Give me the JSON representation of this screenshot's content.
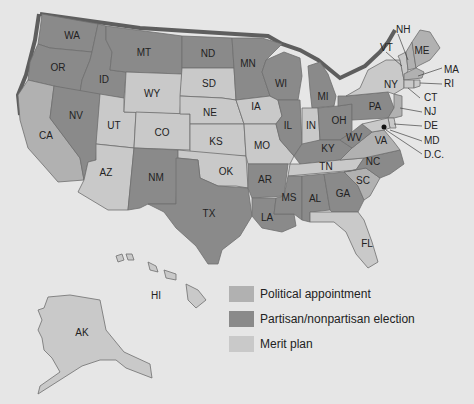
{
  "colors": {
    "background": "#e6e6e6",
    "political_appointment": "#b1b1b1",
    "election": "#8a8a8a",
    "merit_plan": "#c9c9c9",
    "shadow": "#5e5e5e"
  },
  "legend": {
    "items": [
      {
        "label": "Political appointment",
        "category": "political_appointment",
        "color": "#b1b1b1"
      },
      {
        "label": "Partisan/nonpartisan election",
        "category": "election",
        "color": "#8a8a8a"
      },
      {
        "label": "Merit plan",
        "category": "merit_plan",
        "color": "#c9c9c9"
      }
    ]
  },
  "states": {
    "WA": {
      "label": "WA",
      "category": "election"
    },
    "OR": {
      "label": "OR",
      "category": "election"
    },
    "ID": {
      "label": "ID",
      "category": "election"
    },
    "MT": {
      "label": "MT",
      "category": "election"
    },
    "ND": {
      "label": "ND",
      "category": "election"
    },
    "MN": {
      "label": "MN",
      "category": "election"
    },
    "WI": {
      "label": "WI",
      "category": "election"
    },
    "MI": {
      "label": "MI",
      "category": "election"
    },
    "NV": {
      "label": "NV",
      "category": "election"
    },
    "CA": {
      "label": "CA",
      "category": "political_appointment"
    },
    "UT": {
      "label": "UT",
      "category": "merit_plan"
    },
    "WY": {
      "label": "WY",
      "category": "merit_plan"
    },
    "SD": {
      "label": "SD",
      "category": "merit_plan"
    },
    "NE": {
      "label": "NE",
      "category": "merit_plan"
    },
    "IA": {
      "label": "IA",
      "category": "merit_plan"
    },
    "CO": {
      "label": "CO",
      "category": "merit_plan"
    },
    "KS": {
      "label": "KS",
      "category": "merit_plan"
    },
    "MO": {
      "label": "MO",
      "category": "merit_plan"
    },
    "OK": {
      "label": "OK",
      "category": "merit_plan"
    },
    "AZ": {
      "label": "AZ",
      "category": "merit_plan"
    },
    "NM": {
      "label": "NM",
      "category": "election"
    },
    "TX": {
      "label": "TX",
      "category": "election"
    },
    "AR": {
      "label": "AR",
      "category": "election"
    },
    "LA": {
      "label": "LA",
      "category": "election"
    },
    "MS": {
      "label": "MS",
      "category": "election"
    },
    "AL": {
      "label": "AL",
      "category": "election"
    },
    "GA": {
      "label": "GA",
      "category": "election"
    },
    "FL": {
      "label": "FL",
      "category": "merit_plan"
    },
    "SC": {
      "label": "SC",
      "category": "political_appointment"
    },
    "NC": {
      "label": "NC",
      "category": "election"
    },
    "TN": {
      "label": "TN",
      "category": "merit_plan"
    },
    "KY": {
      "label": "KY",
      "category": "election"
    },
    "VA": {
      "label": "VA",
      "category": "political_appointment"
    },
    "WV": {
      "label": "WV",
      "category": "election"
    },
    "OH": {
      "label": "OH",
      "category": "election"
    },
    "IN": {
      "label": "IN",
      "category": "merit_plan"
    },
    "IL": {
      "label": "IL",
      "category": "election"
    },
    "PA": {
      "label": "PA",
      "category": "election"
    },
    "NY": {
      "label": "NY",
      "category": "merit_plan"
    },
    "VT": {
      "label": "VT",
      "category": "merit_plan"
    },
    "NH": {
      "label": "NH",
      "category": "political_appointment"
    },
    "ME": {
      "label": "ME",
      "category": "political_appointment"
    },
    "MA": {
      "label": "MA",
      "category": "political_appointment"
    },
    "RI": {
      "label": "RI",
      "category": "merit_plan"
    },
    "CT": {
      "label": "CT",
      "category": "merit_plan"
    },
    "NJ": {
      "label": "NJ",
      "category": "political_appointment"
    },
    "DE": {
      "label": "DE",
      "category": "merit_plan"
    },
    "MD": {
      "label": "MD",
      "category": "merit_plan"
    },
    "DC": {
      "label": "D.C.",
      "category": "merit_plan"
    },
    "AK": {
      "label": "AK",
      "category": "merit_plan"
    },
    "HI": {
      "label": "HI",
      "category": "merit_plan"
    }
  }
}
